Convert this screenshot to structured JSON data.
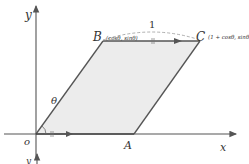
{
  "diagram": {
    "axes": {
      "x_label": "x",
      "y_label": "y",
      "origin_label": "o"
    },
    "points": {
      "O": {
        "label": "O",
        "coords": ""
      },
      "A": {
        "label": "A",
        "coords": ""
      },
      "B": {
        "label": "B",
        "coords": "(cosθ, sinθ)"
      },
      "C": {
        "label": "C",
        "coords": "(1 + cosθ, sinθ"
      }
    },
    "angle_label": "θ",
    "segment_length_label": "1",
    "second_axis_label": "y",
    "colors": {
      "fill": "#ededed",
      "stroke": "#555555",
      "axis": "#555555",
      "dashed": "#999999"
    }
  }
}
